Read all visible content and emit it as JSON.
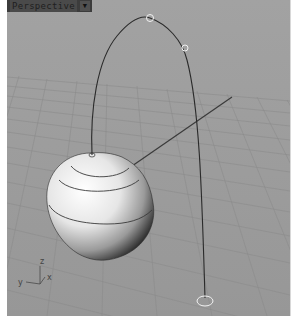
{
  "viewport": {
    "title": "Perspective",
    "dropdown_icon": "triangle-down",
    "background_color": "#9c9c9c",
    "grid_color": "#8a8a8a"
  },
  "axes": {
    "x_label": "x",
    "y_label": "y",
    "z_label": "z"
  },
  "scene": {
    "objects": [
      "revolved-surface",
      "arch-curve",
      "control-points",
      "ground-line"
    ],
    "control_point_count": 4
  }
}
